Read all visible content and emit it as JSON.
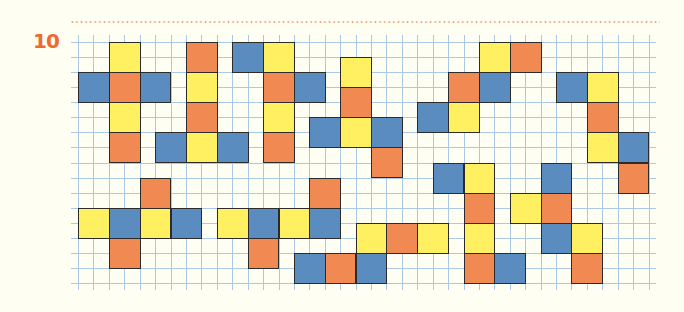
{
  "exercise": {
    "number": "10"
  },
  "colors": {
    "Y": "#FFF062",
    "O": "#F08A52",
    "B": "#5A8CC0",
    "grid_line": "#A9C9E6",
    "number": "#EE6A2E",
    "background": "#FFFEF2"
  },
  "grid": {
    "left": 78,
    "top": 42,
    "cell_w": 15.42,
    "cell_h": 15.06,
    "cols": 37,
    "rows": 16,
    "overhang": 7
  },
  "square_size_cells": 2,
  "pieces": [
    {
      "id": "piece-1",
      "squares": [
        [
          2,
          0,
          "Y"
        ],
        [
          0,
          2,
          "B"
        ],
        [
          2,
          2,
          "O"
        ],
        [
          4,
          2,
          "B"
        ],
        [
          2,
          4,
          "Y"
        ],
        [
          2,
          6,
          "O"
        ]
      ]
    },
    {
      "id": "piece-2",
      "squares": [
        [
          7,
          0,
          "O"
        ],
        [
          7,
          2,
          "Y"
        ],
        [
          7,
          4,
          "O"
        ],
        [
          5,
          6,
          "B"
        ],
        [
          7,
          6,
          "Y"
        ],
        [
          9,
          6,
          "B"
        ]
      ]
    },
    {
      "id": "piece-3",
      "squares": [
        [
          10,
          0,
          "B"
        ],
        [
          12,
          0,
          "Y"
        ],
        [
          12,
          2,
          "O"
        ],
        [
          14,
          2,
          "B"
        ],
        [
          12,
          4,
          "Y"
        ],
        [
          12,
          6,
          "O"
        ]
      ]
    },
    {
      "id": "piece-4",
      "squares": [
        [
          17,
          1,
          "Y"
        ],
        [
          17,
          3,
          "O"
        ],
        [
          15,
          5,
          "B"
        ],
        [
          17,
          5,
          "Y"
        ],
        [
          19,
          5,
          "B"
        ],
        [
          19,
          7,
          "O"
        ]
      ]
    },
    {
      "id": "piece-5",
      "squares": [
        [
          26,
          0,
          "Y"
        ],
        [
          28,
          0,
          "O"
        ],
        [
          24,
          2,
          "O"
        ],
        [
          26,
          2,
          "B"
        ],
        [
          22,
          4,
          "B"
        ],
        [
          24,
          4,
          "Y"
        ]
      ]
    },
    {
      "id": "piece-6",
      "squares": [
        [
          31,
          2,
          "B"
        ],
        [
          33,
          2,
          "Y"
        ],
        [
          33,
          4,
          "O"
        ],
        [
          33,
          6,
          "Y"
        ],
        [
          35,
          6,
          "B"
        ],
        [
          35,
          8,
          "O"
        ]
      ]
    },
    {
      "id": "piece-7",
      "squares": [
        [
          4,
          9,
          "O"
        ],
        [
          0,
          11,
          "Y"
        ],
        [
          2,
          11,
          "B"
        ],
        [
          4,
          11,
          "Y"
        ],
        [
          6,
          11,
          "B"
        ],
        [
          2,
          13,
          "O"
        ]
      ]
    },
    {
      "id": "piece-8",
      "squares": [
        [
          15,
          9,
          "O"
        ],
        [
          9,
          11,
          "Y"
        ],
        [
          11,
          11,
          "B"
        ],
        [
          13,
          11,
          "Y"
        ],
        [
          15,
          11,
          "B"
        ],
        [
          11,
          13,
          "O"
        ]
      ]
    },
    {
      "id": "piece-9",
      "squares": [
        [
          18,
          12,
          "Y"
        ],
        [
          20,
          12,
          "O"
        ],
        [
          22,
          12,
          "Y"
        ],
        [
          14,
          14,
          "B"
        ],
        [
          16,
          14,
          "O"
        ],
        [
          18,
          14,
          "B"
        ]
      ]
    },
    {
      "id": "piece-10",
      "squares": [
        [
          23,
          8,
          "B"
        ],
        [
          25,
          8,
          "Y"
        ],
        [
          25,
          10,
          "O"
        ],
        [
          25,
          12,
          "Y"
        ],
        [
          25,
          14,
          "O"
        ],
        [
          27,
          14,
          "B"
        ]
      ]
    },
    {
      "id": "piece-11",
      "squares": [
        [
          30,
          8,
          "B"
        ],
        [
          28,
          10,
          "Y"
        ],
        [
          30,
          10,
          "O"
        ],
        [
          30,
          12,
          "B"
        ],
        [
          32,
          12,
          "Y"
        ],
        [
          32,
          14,
          "O"
        ]
      ]
    }
  ]
}
